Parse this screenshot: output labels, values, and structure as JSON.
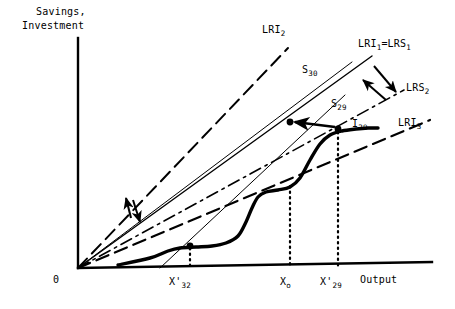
{
  "figure": {
    "background": "#ffffff",
    "ink": "#000000",
    "width": 455,
    "height": 309
  },
  "axes": {
    "y_label_line1": "Savings,",
    "y_label_line2": "Investment",
    "x_label": "Output",
    "origin_label": "0",
    "x_ticks": [
      {
        "id": "x32",
        "label_html": "X'<sub>32</sub>",
        "x": 190
      },
      {
        "id": "x0",
        "label_html": "X<sub>o</sub>",
        "x": 290
      },
      {
        "id": "x29",
        "label_html": "X'<sub>29</sub>",
        "x": 338
      }
    ],
    "vertical_axis_x": 78,
    "horizontal_axis_y": 268
  },
  "curve_labels": {
    "lri2": "LRI",
    "lri2_sub": "2",
    "lri1_lrs1": "LRI",
    "lri1_lrs1_sub": "1",
    "lri1_lrs1_eq": "=LRS",
    "lri1_lrs1_sub2": "1",
    "s30": "S",
    "s30_sub": "30",
    "lrs2": "LRS",
    "lrs2_sub": "2",
    "s29": "S",
    "s29_sub": "29",
    "i29": "I",
    "i29_sub": "29",
    "lri3": "LRI",
    "lri3_sub": "3"
  },
  "chart_data": {
    "type": "line",
    "xlabel": "Output",
    "ylabel": "Savings, Investment",
    "grid": false,
    "legend": "inline-annotations",
    "origin": {
      "x": 78,
      "y": 268
    },
    "xlim": [
      78,
      430
    ],
    "ylim": [
      268,
      40
    ],
    "series": [
      {
        "name": "LRI_2",
        "label": "LRI₂",
        "style": "long-dash",
        "width": 2.0,
        "points": [
          [
            78,
            268
          ],
          [
            288,
            48
          ]
        ],
        "comment": "steepest long-run investment ray, dashed, label at upper area"
      },
      {
        "name": "S_30",
        "label": "S₃₀",
        "style": "solid",
        "width": 1.0,
        "points": [
          [
            78,
            268
          ],
          [
            352,
            62
          ]
        ],
        "comment": "thin solid savings schedule through origin, steep"
      },
      {
        "name": "LRI_1=LRS_1",
        "label": "LRI₁=LRS₁",
        "style": "solid",
        "width": 1.4,
        "points": [
          [
            78,
            268
          ],
          [
            372,
            56
          ]
        ],
        "comment": "solid ray reaching the upper-right label"
      },
      {
        "name": "S_29",
        "label": "S₂₉",
        "style": "solid",
        "width": 1.0,
        "points": [
          [
            160,
            268
          ],
          [
            345,
            95
          ]
        ],
        "comment": "thin steep savings line not through the origin"
      },
      {
        "name": "LRS_2",
        "label": "LRS₂",
        "style": "dash-dot",
        "width": 1.6,
        "points": [
          [
            78,
            268
          ],
          [
            404,
            90
          ]
        ],
        "comment": "dash-dot ray to LRS2 label"
      },
      {
        "name": "LRI_3",
        "label": "LRI₃",
        "style": "long-dash",
        "width": 2.2,
        "points": [
          [
            78,
            268
          ],
          [
            430,
            120
          ]
        ],
        "comment": "flattest long-dash ray, label far right"
      },
      {
        "name": "I_29",
        "label": "I₂₉",
        "style": "solid-thick",
        "width": 3.4,
        "points": [
          [
            118,
            265
          ],
          [
            150,
            258
          ],
          [
            168,
            251
          ],
          [
            180,
            248
          ],
          [
            196,
            247
          ],
          [
            212,
            246
          ],
          [
            226,
            243
          ],
          [
            238,
            236
          ],
          [
            246,
            222
          ],
          [
            252,
            208
          ],
          [
            258,
            197
          ],
          [
            266,
            192
          ],
          [
            278,
            190
          ],
          [
            290,
            187
          ],
          [
            300,
            178
          ],
          [
            310,
            160
          ],
          [
            320,
            144
          ],
          [
            330,
            135
          ],
          [
            342,
            131
          ],
          [
            356,
            129
          ],
          [
            368,
            128
          ],
          [
            378,
            128
          ]
        ],
        "comment": "thick S-shaped investment curve I29"
      }
    ],
    "marked_points": [
      {
        "name": "equilibrium-upper",
        "x": 290,
        "y": 122,
        "marker": "dot"
      },
      {
        "name": "equilibrium-i29-upper",
        "x": 338,
        "y": 129,
        "marker": "dot"
      },
      {
        "name": "equilibrium-lower",
        "x": 190,
        "y": 246,
        "marker": "dot"
      }
    ],
    "dotted_verticals": [
      {
        "name": "drop-x32",
        "x": 190,
        "y_top": 248,
        "y_bottom": 268
      },
      {
        "name": "drop-x0",
        "x": 290,
        "y_top": 186,
        "y_bottom": 268
      },
      {
        "name": "drop-x29",
        "x": 338,
        "y_top": 132,
        "y_bottom": 268
      }
    ],
    "annotation_arrows": [
      {
        "name": "shift-arrow-up-left-upper",
        "from": [
          386,
          100
        ],
        "to": [
          363,
          80
        ],
        "dir": "up-left"
      },
      {
        "name": "shift-arrow-down-right-upper",
        "from": [
          374,
          66
        ],
        "to": [
          396,
          92
        ],
        "dir": "down-right"
      },
      {
        "name": "shift-arrow-up-left-lower",
        "from": [
          131,
          218
        ],
        "to": [
          126,
          198
        ],
        "dir": "up"
      },
      {
        "name": "shift-arrow-down-right-lower",
        "from": [
          133,
          200
        ],
        "to": [
          140,
          222
        ],
        "dir": "down"
      },
      {
        "name": "horizontal-arrow-to-equilibrium",
        "from": [
          335,
          127
        ],
        "to": [
          295,
          122
        ],
        "dir": "left"
      }
    ]
  }
}
